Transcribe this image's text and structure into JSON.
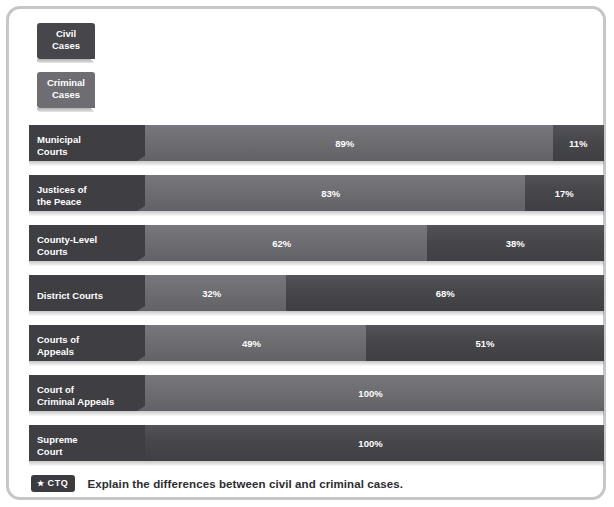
{
  "chart_data": {
    "type": "bar",
    "subtype": "stacked-horizontal-100-percent",
    "title": "",
    "xlabel": "",
    "ylabel": "",
    "xlim": [
      0,
      100
    ],
    "grid": false,
    "legend_position": "top-left",
    "legend": [
      {
        "key": "civil",
        "label": "Civil\nCases",
        "label_lines": [
          "Civil",
          "Cases"
        ],
        "color": "#46464b"
      },
      {
        "key": "criminal",
        "label": "Criminal\nCases",
        "label_lines": [
          "Criminal",
          "Cases"
        ],
        "color": "#6d6d72"
      }
    ],
    "categories": [
      "Municipal Courts",
      "Justices of the Peace",
      "County-Level Courts",
      "District Courts",
      "Courts of Appeals",
      "Court of Criminal Appeals",
      "Supreme Court"
    ],
    "series": [
      {
        "name": "Civil Cases",
        "values": [
          11,
          17,
          38,
          32,
          51,
          0,
          100
        ]
      },
      {
        "name": "Criminal Cases",
        "values": [
          89,
          83,
          62,
          68,
          49,
          100,
          0
        ]
      }
    ],
    "rows": [
      {
        "label_lines": [
          "Municipal",
          "Courts"
        ],
        "segments": [
          {
            "key": "criminal",
            "value": 89,
            "value_label": "89%"
          },
          {
            "key": "civil",
            "value": 11,
            "value_label": "11%"
          }
        ]
      },
      {
        "label_lines": [
          "Justices of",
          "the Peace"
        ],
        "segments": [
          {
            "key": "criminal",
            "value": 83,
            "value_label": "83%"
          },
          {
            "key": "civil",
            "value": 17,
            "value_label": "17%"
          }
        ]
      },
      {
        "label_lines": [
          "County-Level",
          "Courts"
        ],
        "segments": [
          {
            "key": "criminal",
            "value": 62,
            "value_label": "62%"
          },
          {
            "key": "civil",
            "value": 38,
            "value_label": "38%"
          }
        ]
      },
      {
        "label_lines": [
          "District Courts"
        ],
        "segments": [
          {
            "key": "criminal",
            "value": 32,
            "value_label": "32%"
          },
          {
            "key": "civil",
            "value": 68,
            "value_label": "68%"
          }
        ]
      },
      {
        "label_lines": [
          "Courts of",
          "Appeals"
        ],
        "segments": [
          {
            "key": "criminal",
            "value": 49,
            "value_label": "49%"
          },
          {
            "key": "civil",
            "value": 51,
            "value_label": "51%"
          }
        ]
      },
      {
        "label_lines": [
          "Court of",
          "Criminal Appeals"
        ],
        "segments": [
          {
            "key": "criminal",
            "value": 100,
            "value_label": "100%"
          }
        ]
      },
      {
        "label_lines": [
          "Supreme",
          "Court"
        ],
        "segments": [
          {
            "key": "civil",
            "value": 100,
            "value_label": "100%"
          }
        ]
      }
    ]
  },
  "footer": {
    "badge_star": "★",
    "badge_label": "CTQ",
    "prompt": "Explain the differences between civil and criminal cases."
  },
  "colors": {
    "civil": "#46464b",
    "criminal": "#6d6d72",
    "label_block": "#3e3e43",
    "frame_border": "#c6c6c9",
    "background": "#ffffff",
    "text_on_bar": "#ffffff",
    "footer_text": "#2c2c31"
  }
}
